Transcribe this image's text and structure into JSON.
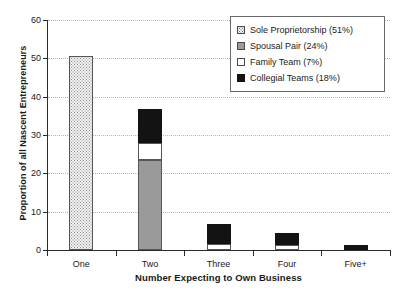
{
  "chart_data": {
    "type": "bar",
    "subtype": "stacked",
    "title": "",
    "xlabel": "Number Expecting to Own Business",
    "ylabel": "Proportion of all Nascent Entrepreneurs",
    "categories": [
      "One",
      "Two",
      "Three",
      "Four",
      "Five+"
    ],
    "ylim": [
      0,
      60
    ],
    "yticks": [
      0,
      10,
      20,
      30,
      40,
      50,
      60
    ],
    "ytick_labels": [
      "0",
      "10",
      "20",
      "30",
      "40",
      "50",
      "60"
    ],
    "grid": "horizontal-dotted",
    "legend_position": "top-right",
    "series": [
      {
        "name": "Sole Proprietorship (51%)",
        "short_name": "Sole Proprietorship",
        "share": "51%",
        "fill": "dotted-stipple",
        "color": "#f2f2f2",
        "values": [
          50.5,
          0,
          0,
          0,
          0
        ]
      },
      {
        "name": "Spousal Pair (24%)",
        "short_name": "Spousal Pair",
        "share": "24%",
        "fill": "solid",
        "color": "#9a9a9a",
        "values": [
          0,
          23.5,
          0,
          0,
          0
        ]
      },
      {
        "name": "Family Team (7%)",
        "short_name": "Family Team",
        "share": "7%",
        "fill": "solid",
        "color": "#ffffff",
        "values": [
          0,
          4.5,
          1.5,
          1.2,
          0
        ]
      },
      {
        "name": "Collegial Teams (18%)",
        "short_name": "Collegial Teams",
        "share": "18%",
        "fill": "solid",
        "color": "#131313",
        "values": [
          0,
          8.8,
          5.4,
          3.2,
          1.3
        ]
      }
    ],
    "totals": [
      50.5,
      36.8,
      6.9,
      4.4,
      1.3
    ]
  },
  "axes": {
    "y": {
      "label": "Proportion of all Nascent Entrepreneurs",
      "ticks": [
        {
          "label": "60",
          "value": 60
        },
        {
          "label": "50",
          "value": 50
        },
        {
          "label": "40",
          "value": 40
        },
        {
          "label": "30",
          "value": 30
        },
        {
          "label": "20",
          "value": 20
        },
        {
          "label": "10",
          "value": 10
        },
        {
          "label": "0",
          "value": 0
        }
      ]
    },
    "x": {
      "label": "Number Expecting to Own Business",
      "ticks": [
        {
          "label": "One"
        },
        {
          "label": "Two"
        },
        {
          "label": "Three"
        },
        {
          "label": "Four"
        },
        {
          "label": "Five+"
        }
      ]
    }
  },
  "legend": {
    "entries": [
      {
        "label": "Sole Proprietorship (51%)",
        "swatch": "sole"
      },
      {
        "label": "Spousal Pair (24%)",
        "swatch": "spousal"
      },
      {
        "label": "Family Team (7%)",
        "swatch": "family"
      },
      {
        "label": "Collegial Teams (18%)",
        "swatch": "collegial"
      }
    ]
  },
  "colors": {
    "axis": "#2b2b2b",
    "grid": "#b6b6b6",
    "sole": "#f2f2f2",
    "spousal": "#9a9a9a",
    "family": "#ffffff",
    "collegial": "#131313",
    "background": "#ffffff"
  }
}
